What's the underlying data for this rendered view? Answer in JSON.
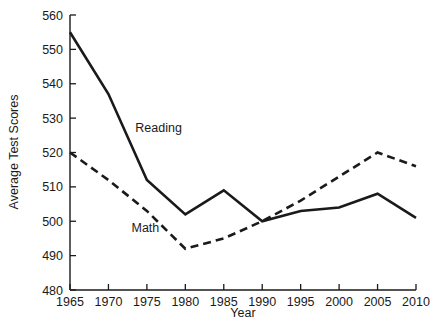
{
  "chart_data": {
    "type": "line",
    "title": "",
    "subtitle": "",
    "xlabel": "Year",
    "ylabel": "Average Test Scores",
    "x": [
      1965,
      1970,
      1975,
      1980,
      1985,
      1990,
      1995,
      2000,
      2005,
      2010
    ],
    "xtick_labels": [
      "1965",
      "1970",
      "1975",
      "1980",
      "1985",
      "1990",
      "1995",
      "2000",
      "2005",
      "2010"
    ],
    "ytick_labels": [
      "480",
      "490",
      "500",
      "510",
      "520",
      "530",
      "540",
      "550",
      "560"
    ],
    "yticks": [
      480,
      490,
      500,
      510,
      520,
      530,
      540,
      550,
      560
    ],
    "xlim": [
      1965,
      2010
    ],
    "ylim": [
      480,
      560
    ],
    "grid": false,
    "legend_position": "inline-annotation",
    "series": [
      {
        "name": "Reading",
        "style": "solid",
        "color": "#1a1a1a",
        "values": [
          555,
          537,
          512,
          502,
          509,
          500,
          503,
          504,
          508,
          501
        ]
      },
      {
        "name": "Math",
        "style": "dashed",
        "color": "#1a1a1a",
        "values": [
          520,
          512,
          503,
          492,
          495,
          500,
          506,
          513,
          520,
          516
        ]
      }
    ],
    "annotations": [
      {
        "text": "Reading",
        "x_value": 1973.5,
        "y_value": 526
      },
      {
        "text": "Math",
        "x_value": 1973.0,
        "y_value": 497
      }
    ]
  }
}
